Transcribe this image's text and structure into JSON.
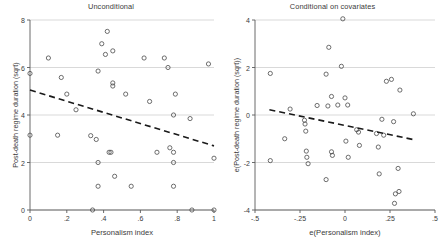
{
  "figure": {
    "width": 443,
    "height": 252,
    "background": "#ffffff",
    "grid_color": "#c8c8c8",
    "axis_color": "#5a5a5a",
    "marker_color": "#4a4a4a",
    "fit_line_color": "#1a1a1a",
    "text_color": "#3a3a3a"
  },
  "chart_data": [
    {
      "id": "unconditional",
      "type": "scatter",
      "title": "Unconditional",
      "xlabel": "Personalism index",
      "ylabel": "Post-death regime duration (sqrt)",
      "xlim": [
        0,
        1
      ],
      "ylim": [
        0,
        8
      ],
      "xticks": [
        0,
        0.2,
        0.4,
        0.6,
        0.8,
        1
      ],
      "xticklabels": [
        "0",
        ".2",
        ".4",
        ".6",
        ".8",
        "1"
      ],
      "yticks": [
        0,
        2,
        4,
        6,
        8
      ],
      "yticklabels": [
        "0",
        "2",
        "4",
        "6",
        "8"
      ],
      "grid": "horizontal",
      "legend": "none",
      "marker": "open-circle",
      "fit_line": {
        "style": "dashed",
        "x": [
          0,
          1
        ],
        "y": [
          5.05,
          2.7
        ]
      },
      "points": [
        {
          "x": 0.0,
          "y": 5.75
        },
        {
          "x": 0.0,
          "y": 3.15
        },
        {
          "x": 0.1,
          "y": 6.4
        },
        {
          "x": 0.15,
          "y": 3.15
        },
        {
          "x": 0.17,
          "y": 5.58
        },
        {
          "x": 0.2,
          "y": 4.88
        },
        {
          "x": 0.25,
          "y": 4.22
        },
        {
          "x": 0.33,
          "y": 3.13
        },
        {
          "x": 0.34,
          "y": 0.0
        },
        {
          "x": 0.36,
          "y": 2.97
        },
        {
          "x": 0.37,
          "y": 5.85
        },
        {
          "x": 0.37,
          "y": 2.0
        },
        {
          "x": 0.37,
          "y": 1.0
        },
        {
          "x": 0.39,
          "y": 7.0
        },
        {
          "x": 0.41,
          "y": 6.55
        },
        {
          "x": 0.42,
          "y": 7.52
        },
        {
          "x": 0.43,
          "y": 2.43
        },
        {
          "x": 0.44,
          "y": 2.43
        },
        {
          "x": 0.45,
          "y": 6.7
        },
        {
          "x": 0.45,
          "y": 5.35
        },
        {
          "x": 0.45,
          "y": 5.22
        },
        {
          "x": 0.46,
          "y": 1.42
        },
        {
          "x": 0.52,
          "y": 4.88
        },
        {
          "x": 0.55,
          "y": 1.0
        },
        {
          "x": 0.62,
          "y": 6.4
        },
        {
          "x": 0.65,
          "y": 4.57
        },
        {
          "x": 0.69,
          "y": 2.43
        },
        {
          "x": 0.73,
          "y": 6.4
        },
        {
          "x": 0.75,
          "y": 6.0
        },
        {
          "x": 0.76,
          "y": 2.62
        },
        {
          "x": 0.78,
          "y": 4.0
        },
        {
          "x": 0.78,
          "y": 2.43
        },
        {
          "x": 0.78,
          "y": 2.0
        },
        {
          "x": 0.78,
          "y": 1.0
        },
        {
          "x": 0.79,
          "y": 4.88
        },
        {
          "x": 0.87,
          "y": 3.85
        },
        {
          "x": 0.88,
          "y": 0.0
        },
        {
          "x": 0.97,
          "y": 6.15
        },
        {
          "x": 1.0,
          "y": 2.18
        },
        {
          "x": 1.0,
          "y": 0.0
        }
      ]
    },
    {
      "id": "conditional",
      "type": "scatter",
      "title": "Conditional on covariates",
      "xlabel": "e(Personalism index)",
      "ylabel": "e(Post-death regime duration (sqrt))",
      "xlim": [
        -0.5,
        0.5
      ],
      "ylim": [
        -4,
        4
      ],
      "xticks": [
        -0.5,
        -0.25,
        0,
        0.25,
        0.5
      ],
      "xticklabels": [
        "-.5",
        "-.25",
        "0",
        ".25",
        ".5"
      ],
      "yticks": [
        -4,
        -2,
        0,
        2,
        4
      ],
      "yticklabels": [
        "-4",
        "-2",
        "0",
        "2",
        "4"
      ],
      "grid": "horizontal",
      "legend": "none",
      "marker": "open-circle",
      "fit_line": {
        "style": "dashed",
        "x": [
          -0.42,
          0.39
        ],
        "y": [
          0.22,
          -1.05
        ]
      },
      "points": [
        {
          "x": -0.415,
          "y": 1.75
        },
        {
          "x": -0.415,
          "y": -1.92
        },
        {
          "x": -0.335,
          "y": -1.0
        },
        {
          "x": -0.305,
          "y": 0.25
        },
        {
          "x": -0.225,
          "y": -0.22
        },
        {
          "x": -0.222,
          "y": -0.38
        },
        {
          "x": -0.218,
          "y": -0.68
        },
        {
          "x": -0.215,
          "y": -1.52
        },
        {
          "x": -0.212,
          "y": -1.78
        },
        {
          "x": -0.205,
          "y": -2.05
        },
        {
          "x": -0.155,
          "y": 0.4
        },
        {
          "x": -0.105,
          "y": 1.72
        },
        {
          "x": -0.105,
          "y": -2.72
        },
        {
          "x": -0.095,
          "y": 0.38
        },
        {
          "x": -0.09,
          "y": 2.85
        },
        {
          "x": -0.075,
          "y": 0.78
        },
        {
          "x": -0.075,
          "y": -1.55
        },
        {
          "x": -0.07,
          "y": -1.7
        },
        {
          "x": -0.04,
          "y": 0.42
        },
        {
          "x": -0.02,
          "y": 2.05
        },
        {
          "x": -0.012,
          "y": 4.05
        },
        {
          "x": 0.0,
          "y": 0.72
        },
        {
          "x": 0.005,
          "y": -1.1
        },
        {
          "x": 0.015,
          "y": 0.42
        },
        {
          "x": 0.018,
          "y": -1.78
        },
        {
          "x": 0.065,
          "y": -0.62
        },
        {
          "x": 0.075,
          "y": -0.72
        },
        {
          "x": 0.08,
          "y": -1.28
        },
        {
          "x": 0.175,
          "y": -0.78
        },
        {
          "x": 0.185,
          "y": -1.35
        },
        {
          "x": 0.19,
          "y": -2.48
        },
        {
          "x": 0.205,
          "y": -0.18
        },
        {
          "x": 0.215,
          "y": -0.85
        },
        {
          "x": 0.23,
          "y": 1.42
        },
        {
          "x": 0.258,
          "y": 1.5
        },
        {
          "x": 0.27,
          "y": -0.28
        },
        {
          "x": 0.275,
          "y": -3.72
        },
        {
          "x": 0.28,
          "y": -3.32
        },
        {
          "x": 0.295,
          "y": -2.25
        },
        {
          "x": 0.3,
          "y": -3.22
        },
        {
          "x": 0.305,
          "y": 1.05
        },
        {
          "x": 0.38,
          "y": 0.05
        }
      ]
    }
  ]
}
